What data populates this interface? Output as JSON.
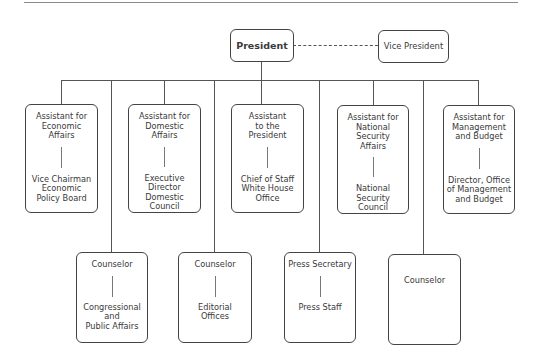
{
  "chart": {
    "top": {
      "president": "President",
      "vice_president": "Vice President"
    },
    "assistants": [
      {
        "title": "Assistant for\nEconomic\nAffairs",
        "sub": "Vice Chairman\nEconomic\nPolicy Board"
      },
      {
        "title": "Assistant for\nDomestic\nAffairs",
        "sub": "Executive\nDirector\nDomestic Council"
      },
      {
        "title": "Assistant\nto the\nPresident",
        "sub": "Chief of Staff\nWhite House\nOffice"
      },
      {
        "title": "Assistant for\nNational Security\nAffairs",
        "sub": "National\nSecurity\nCouncil"
      },
      {
        "title": "Assistant for\nManagement\nand Budget",
        "sub": "Director, Office\nof Management\nand Budget"
      }
    ],
    "lower": [
      {
        "title": "Counselor",
        "sub": "Congressional\nand\nPublic Affairs"
      },
      {
        "title": "Counselor",
        "sub": "Editorial\nOffices"
      },
      {
        "title": "Press Secretary",
        "sub": "Press Staff"
      },
      {
        "title": "Counselor",
        "sub": ""
      }
    ]
  }
}
